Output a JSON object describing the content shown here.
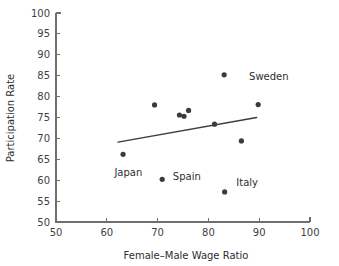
{
  "chart_data": {
    "type": "scatter",
    "title": "",
    "xlabel": "Female–Male Wage Ratio",
    "ylabel": "Participation Rate",
    "xlim": [
      50,
      100
    ],
    "ylim": [
      50,
      100
    ],
    "xticks": [
      50,
      60,
      70,
      80,
      90,
      100
    ],
    "yticks": [
      50,
      55,
      60,
      65,
      70,
      75,
      80,
      85,
      90,
      95,
      100
    ],
    "grid": false,
    "legend": "none",
    "marker_color": "#3b3b3b",
    "line_color": "#3b3b3b",
    "axis_color": "#6f6f6f",
    "points": [
      {
        "x": 63.2,
        "y": 66.2,
        "label": ""
      },
      {
        "x": 69.4,
        "y": 78.0,
        "label": ""
      },
      {
        "x": 70.9,
        "y": 60.2,
        "label": ""
      },
      {
        "x": 74.3,
        "y": 75.6,
        "label": ""
      },
      {
        "x": 75.2,
        "y": 75.3,
        "label": ""
      },
      {
        "x": 76.1,
        "y": 76.7,
        "label": ""
      },
      {
        "x": 81.2,
        "y": 73.4,
        "label": ""
      },
      {
        "x": 83.1,
        "y": 85.2,
        "label": ""
      },
      {
        "x": 83.2,
        "y": 57.2,
        "label": ""
      },
      {
        "x": 86.5,
        "y": 69.4,
        "label": ""
      },
      {
        "x": 89.8,
        "y": 78.1,
        "label": ""
      }
    ],
    "annotations": [
      {
        "text": "Sweden",
        "x": 88.0,
        "y": 84.0
      },
      {
        "text": "Japan",
        "x": 61.5,
        "y": 61.0
      },
      {
        "text": "Spain",
        "x": 73.0,
        "y": 60.0
      },
      {
        "text": "Italy",
        "x": 85.5,
        "y": 58.5
      }
    ],
    "trendline": {
      "x0": 62.2,
      "y0": 69.1,
      "x1": 89.5,
      "y1": 75.0
    }
  }
}
